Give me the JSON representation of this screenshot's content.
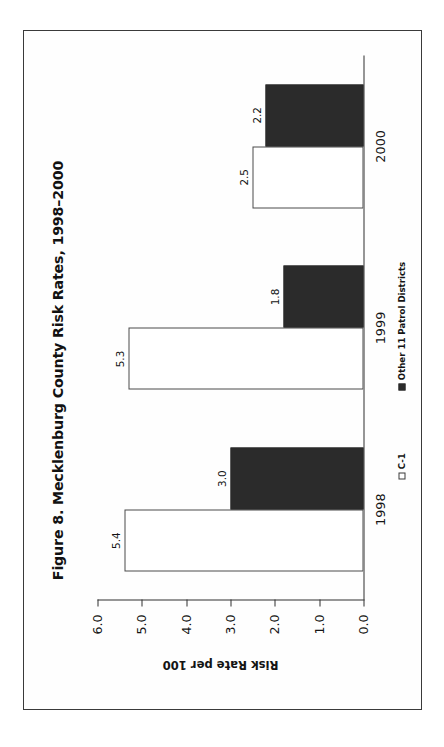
{
  "figure": {
    "title": "Figure 8. Mecklenburg County Risk Rates, 1998–2000"
  },
  "chart_data": {
    "type": "bar",
    "title": "Figure 8. Mecklenburg County Risk Rates, 1998–2000",
    "orientation": "vertical-columns-printed-rotated-90ccw",
    "xlabel": "",
    "ylabel": "Risk Rate per 100",
    "categories": [
      "1998",
      "1999",
      "2000"
    ],
    "series": [
      {
        "name": "C-1",
        "color": "#ffffff",
        "border_color": "#4a4a4a",
        "values": [
          5.4,
          5.3,
          2.5
        ],
        "labels": [
          "5.4",
          "5.3",
          "2.5"
        ]
      },
      {
        "name": "Other 11 Patrol Districts",
        "color": "#2b2b2b",
        "border_color": "#2b2b2b",
        "values": [
          3.0,
          1.8,
          2.2
        ],
        "labels": [
          "3.0",
          "1.8",
          "2.2"
        ]
      }
    ],
    "ylim": [
      0.0,
      6.0
    ],
    "yticks": [
      0.0,
      1.0,
      2.0,
      3.0,
      4.0,
      5.0,
      6.0
    ],
    "ytick_labels": [
      "0.0",
      "1.0",
      "2.0",
      "3.0",
      "4.0",
      "5.0",
      "6.0"
    ],
    "grid": false,
    "legend_position": "bottom",
    "legend": [
      "C-1",
      "Other 11 Patrol Districts"
    ]
  }
}
